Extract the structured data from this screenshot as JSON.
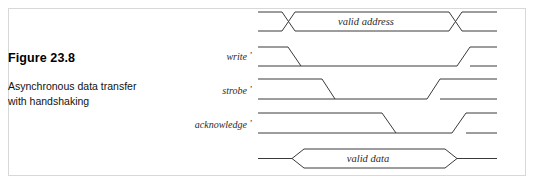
{
  "figure": {
    "number": "Figure 23.8",
    "caption_line_1": "Asynchronous data transfer",
    "caption_line_2": "with handshaking"
  },
  "diagram": {
    "type": "timing-diagram",
    "border_color": "#d8d8d8",
    "line_color": "#3a3a3a",
    "signals": [
      {
        "name": "address-bus",
        "label": "",
        "prime": "",
        "kind": "bus-crossing",
        "bus_value": "valid address",
        "row_top": 12,
        "row_bottom": 31,
        "start_x": 258,
        "end_x": 497,
        "valid_start_x": 282,
        "valid_end_x": 449,
        "cross_width": 13
      },
      {
        "name": "write",
        "label": "write",
        "prime": "’",
        "kind": "signal",
        "row_top": 47,
        "row_bottom": 66,
        "start_x": 258,
        "end_x": 497,
        "fall_start_x": 288,
        "fall_end_x": 301,
        "rise_start_x": 457,
        "rise_end_x": 470,
        "initial_level": "high"
      },
      {
        "name": "strobe",
        "label": "strobe",
        "prime": "’",
        "kind": "signal",
        "row_top": 79,
        "row_bottom": 99,
        "start_x": 258,
        "end_x": 497,
        "fall_start_x": 322,
        "fall_end_x": 335,
        "rise_start_x": 427,
        "rise_end_x": 440,
        "initial_level": "high"
      },
      {
        "name": "acknowledge",
        "label": "acknowledge",
        "prime": "’",
        "kind": "signal",
        "row_top": 113,
        "row_bottom": 133,
        "start_x": 258,
        "end_x": 497,
        "fall_start_x": 382,
        "fall_end_x": 396,
        "rise_start_x": 452,
        "rise_end_x": 466,
        "initial_level": "high"
      },
      {
        "name": "data-bus",
        "label": "",
        "prime": "",
        "kind": "bus-hex",
        "bus_value": "valid data",
        "row_top": 149,
        "row_bottom": 168,
        "start_x": 258,
        "end_x": 497,
        "valid_start_x": 292,
        "valid_end_x": 445,
        "cross_width": 12
      }
    ],
    "label_x": 252,
    "labels": [
      {
        "text": "write",
        "prime": "’",
        "x": 252,
        "y": 60
      },
      {
        "text": "strobe",
        "prime": "’",
        "x": 252,
        "y": 94
      },
      {
        "text": "acknowledge",
        "prime": "’",
        "x": 252,
        "y": 128
      }
    ],
    "bus_texts": [
      {
        "text": "valid address",
        "x": 366,
        "y": 25
      },
      {
        "text": "valid data",
        "x": 368,
        "y": 162
      }
    ]
  }
}
